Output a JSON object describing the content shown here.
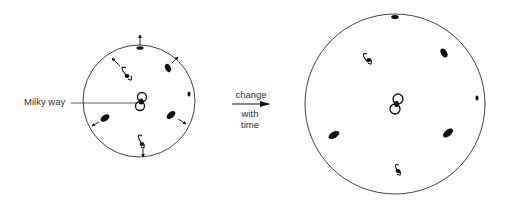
{
  "labels": {
    "milky_way": "Milky way",
    "arrow_top": "change",
    "arrow_bottom_1": "with",
    "arrow_bottom_2": "time"
  },
  "panels": [
    {
      "name": "before",
      "center": [
        139,
        100
      ],
      "radius": 56
    },
    {
      "name": "after",
      "center": [
        395,
        104
      ],
      "radius": 90
    }
  ],
  "colors": {
    "stroke": "#333333",
    "galaxy": "#111111",
    "background": "#ffffff"
  }
}
